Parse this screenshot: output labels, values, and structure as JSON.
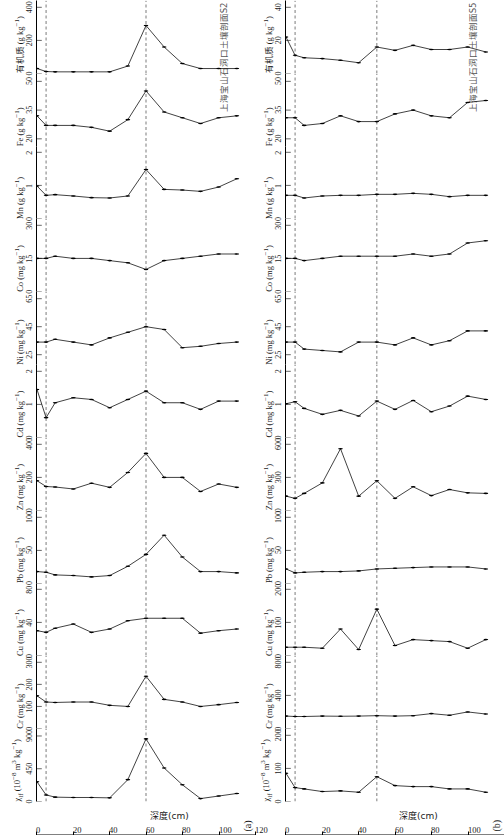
{
  "figure": {
    "x_axis_title": "深度(cm)",
    "x_ticks": [
      0,
      20,
      40,
      60,
      80,
      100,
      120
    ],
    "x_range": [
      0,
      120
    ],
    "depths": [
      0,
      5,
      10,
      20,
      30,
      40,
      50,
      60,
      70,
      80,
      90,
      100,
      110
    ]
  },
  "profiles": [
    {
      "tag": "(a)",
      "caption": "上海宝山石洞口土壤剖面S2",
      "marker_lines": [
        5,
        60
      ],
      "panels": [
        {
          "name": "chi-lf",
          "label_html": "&chi;<sub>lf</sub> (10<sup>&minus;8</sup> m<sup>3</sup> kg<sup>&minus;1</sup>)",
          "label_text": "χlf (10−8 m3 kg−1)",
          "ticks": [
            0,
            450,
            900
          ],
          "range": [
            0,
            1000
          ],
          "values": [
            270,
            90,
            60,
            55,
            55,
            50,
            300,
            860,
            460,
            230,
            40,
            75,
            110
          ]
        },
        {
          "name": "Cr",
          "label_html": "Cr (mg kg<sup>&minus;1</sup>)",
          "label_text": "Cr (mg kg−1)",
          "ticks": [
            0,
            100,
            200,
            300
          ],
          "range": [
            0,
            330
          ],
          "values": [
            148,
            120,
            118,
            120,
            120,
            105,
            100,
            237,
            132,
            120,
            100,
            108,
            118
          ]
        },
        {
          "name": "Cu",
          "label_html": "Cu (mg kg<sup>&minus;1</sup>)",
          "label_text": "Cu (mg kg−1)",
          "ticks": [
            0,
            40,
            80
          ],
          "range": [
            0,
            88
          ],
          "values": [
            30,
            28,
            33,
            38,
            28,
            32,
            42,
            45,
            45,
            45,
            27,
            30,
            32
          ]
        },
        {
          "name": "Pb",
          "label_html": "Pb (mg kg<sup>&minus;1</sup>)",
          "label_text": "Pb (mg kg−1)",
          "ticks": [
            0,
            50,
            100
          ],
          "range": [
            0,
            110
          ],
          "values": [
            18,
            17,
            13,
            12,
            10,
            12,
            26,
            44,
            73,
            40,
            18,
            18,
            16,
            19
          ]
        },
        {
          "name": "Zn",
          "label_html": "Zn (mg kg<sup>&minus;1</sup>)",
          "label_text": "Zn (mg kg−1)",
          "ticks": [
            0,
            200,
            400
          ],
          "range": [
            0,
            440
          ],
          "values": [
            180,
            145,
            142,
            130,
            165,
            140,
            230,
            345,
            200,
            200,
            115,
            160,
            140
          ]
        },
        {
          "name": "Cd",
          "label_html": "Cd (mg kg<sup>&minus;1</sup>)",
          "label_text": "Cd (mg kg−1)",
          "ticks": [
            0,
            1,
            2
          ],
          "range": [
            0,
            2.2
          ],
          "values": [
            1.45,
            0.6,
            1.05,
            1.2,
            1.15,
            0.9,
            1.15,
            1.4,
            1.05,
            1.05,
            0.85,
            1.1,
            1.1
          ]
        },
        {
          "name": "Ni",
          "label_html": "Ni (mg kg<sup>&minus;1</sup>)",
          "label_text": "Ni (mg kg−1)",
          "ticks": [
            25,
            45,
            65
          ],
          "range": [
            18,
            70
          ],
          "values": [
            34,
            34,
            36,
            34,
            32,
            37,
            41,
            45,
            43,
            30,
            31,
            33,
            34
          ]
        },
        {
          "name": "Co",
          "label_html": "Co (mg kg<sup>&minus;1</sup>)",
          "label_text": "Co (mg kg−1)",
          "ticks": [
            0,
            15,
            30
          ],
          "range": [
            0,
            33
          ],
          "values": [
            15,
            15,
            16,
            15,
            15,
            14,
            13,
            10,
            14,
            15,
            16,
            17,
            17
          ]
        },
        {
          "name": "Mn",
          "label_html": "Mn (g kg<sup>&minus;1</sup>)",
          "label_text": "Mn (g kg−1)",
          "ticks": [
            0,
            1,
            2
          ],
          "range": [
            0,
            2.2
          ],
          "values": [
            0.98,
            0.7,
            0.72,
            0.68,
            0.63,
            0.62,
            0.68,
            1.48,
            0.88,
            0.86,
            0.82,
            0.95,
            1.2
          ]
        },
        {
          "name": "Fe",
          "label_html": "Fe (g kg<sup>&minus;1</sup>)",
          "label_text": "Fe (g kg−1)",
          "ticks": [
            20,
            35,
            50
          ],
          "range": [
            16,
            54
          ],
          "values": [
            32,
            27,
            27,
            27,
            26,
            24,
            30,
            45,
            34,
            31,
            28,
            31,
            32
          ]
        },
        {
          "name": "organic-matter",
          "label_html": "有机质 (g kg<sup>&minus;1</sup>)",
          "label_text": "有机质 (g kg−1)",
          "ticks": [
            0,
            200,
            400
          ],
          "range": [
            0,
            440
          ],
          "values": [
            30,
            12,
            10,
            10,
            10,
            10,
            45,
            290,
            160,
            60,
            30,
            30,
            30
          ]
        }
      ]
    },
    {
      "tag": "(b)",
      "caption": "上海宝山石洞口土壤剖面S5",
      "marker_lines": [
        5,
        50
      ],
      "panels": [
        {
          "name": "chi-lf",
          "label_html": "&chi;<sub>lf</sub> (10<sup>&minus;8</sup> m<sup>3</sup> kg<sup>&minus;1</sup>)",
          "label_text": "χlf (10−8 m3 kg−1)",
          "ticks": [
            0,
            100,
            200
          ],
          "range": [
            0,
            220
          ],
          "values": [
            85,
            42,
            38,
            30,
            32,
            28,
            75,
            48,
            45,
            45,
            38,
            38,
            28
          ]
        },
        {
          "name": "Cr",
          "label_html": "Cr (mg kg<sup>&minus;1</sup>)",
          "label_text": "Cr (mg kg−1)",
          "ticks": [
            0,
            400,
            800
          ],
          "range": [
            0,
            880
          ],
          "values": [
            150,
            145,
            145,
            150,
            148,
            150,
            155,
            150,
            155,
            180,
            160,
            200,
            175
          ]
        },
        {
          "name": "Cu",
          "label_html": "Cu (mg kg<sup>&minus;1</sup>)",
          "label_text": "Cu (mg kg−1)",
          "ticks": [
            0,
            100,
            200
          ],
          "range": [
            0,
            220
          ],
          "values": [
            25,
            25,
            25,
            22,
            80,
            18,
            140,
            30,
            48,
            45,
            42,
            22,
            48
          ]
        },
        {
          "name": "Pb",
          "label_html": "Pb (mg kg<sup>&minus;1</sup>)",
          "label_text": "Pb (mg kg−1)",
          "ticks": [
            0,
            50,
            100
          ],
          "range": [
            0,
            110
          ],
          "values": [
            22,
            16,
            17,
            18,
            18,
            19,
            22,
            23,
            24,
            25,
            25,
            25,
            22
          ]
        },
        {
          "name": "Zn",
          "label_html": "Zn (mg kg<sup>&minus;1</sup>)",
          "label_text": "Zn (mg kg−1)",
          "ticks": [
            0,
            300,
            600
          ],
          "range": [
            0,
            660
          ],
          "values": [
            130,
            110,
            155,
            250,
            560,
            130,
            270,
            110,
            215,
            135,
            190,
            160,
            155
          ]
        },
        {
          "name": "Cd",
          "label_html": "Cd (mg kg<sup>&minus;1</sup>)",
          "label_text": "Cd (mg kg−1)",
          "ticks": [
            0,
            1,
            2
          ],
          "range": [
            0,
            2.2
          ],
          "values": [
            1.02,
            1.08,
            0.88,
            0.7,
            0.82,
            0.65,
            1.1,
            0.85,
            1.12,
            0.78,
            0.95,
            1.25,
            1.15
          ]
        },
        {
          "name": "Ni",
          "label_html": "Ni (mg kg<sup>&minus;1</sup>)",
          "label_text": "Ni (mg kg−1)",
          "ticks": [
            25,
            45,
            65
          ],
          "range": [
            18,
            70
          ],
          "values": [
            34,
            34,
            29,
            28,
            27,
            34,
            34,
            32,
            37,
            32,
            35,
            42,
            42
          ]
        },
        {
          "name": "Co",
          "label_html": "Co (mg kg<sup>&minus;1</sup>)",
          "label_text": "Co (mg kg−1)",
          "ticks": [
            0,
            15,
            30
          ],
          "range": [
            0,
            33
          ],
          "values": [
            15,
            15,
            14,
            15,
            16,
            16,
            16,
            16,
            17,
            16,
            17,
            22,
            23
          ]
        },
        {
          "name": "Mn",
          "label_html": "Mn (g kg<sup>&minus;1</sup>)",
          "label_text": "Mn (g kg−1)",
          "ticks": [
            0,
            1,
            2
          ],
          "range": [
            0,
            2.2
          ],
          "values": [
            0.7,
            0.7,
            0.62,
            0.68,
            0.7,
            0.7,
            0.73,
            0.73,
            0.76,
            0.73,
            0.66,
            0.7,
            0.7
          ]
        },
        {
          "name": "Fe",
          "label_html": "Fe (g kg<sup>&minus;1</sup>)",
          "label_text": "Fe (g kg−1)",
          "ticks": [
            20,
            35,
            50
          ],
          "range": [
            16,
            54
          ],
          "values": [
            31,
            31,
            27,
            28,
            32,
            29,
            29,
            33,
            35,
            32,
            31,
            39,
            40
          ]
        },
        {
          "name": "organic-matter",
          "label_html": "有机质 (g kg<sup>&minus;1</sup>)",
          "label_text": "有机质 (g kg−1)",
          "ticks": [
            0,
            20,
            40
          ],
          "range": [
            0,
            44
          ],
          "values": [
            22,
            11,
            9.5,
            9,
            8,
            6.5,
            16,
            14,
            17,
            14.5,
            14.5,
            16,
            13
          ]
        }
      ]
    }
  ]
}
